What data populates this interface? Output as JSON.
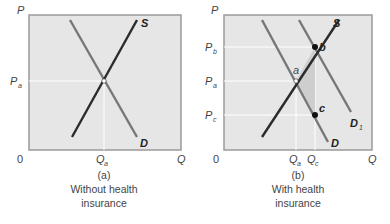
{
  "panels": [
    {
      "id": "a",
      "caption_letter": "(a)",
      "caption_line1": "Without health",
      "caption_line2": "insurance",
      "axis": {
        "y_label": "P",
        "x_label": "Q",
        "origin": "0"
      },
      "price_ticks": [
        {
          "label": "P",
          "sub": "a"
        }
      ],
      "quantity_ticks": [
        {
          "label": "Q",
          "sub": "a"
        }
      ],
      "curves": {
        "supply": "S",
        "demand": "D"
      }
    },
    {
      "id": "b",
      "caption_letter": "(b)",
      "caption_line1": "With health",
      "caption_line2": "insurance",
      "axis": {
        "y_label": "P",
        "x_label": "Q",
        "origin": "0"
      },
      "price_ticks": [
        {
          "label": "P",
          "sub": "b"
        },
        {
          "label": "P",
          "sub": "a"
        },
        {
          "label": "P",
          "sub": "c"
        }
      ],
      "quantity_ticks": [
        {
          "label": "Q",
          "sub": "a"
        },
        {
          "label": "Q",
          "sub": "c"
        }
      ],
      "curves": {
        "supply": "S",
        "demand": "D",
        "demand_shifted": "D",
        "demand_shifted_sub": "1"
      },
      "points": {
        "a": "a",
        "b": "b",
        "c": "c"
      }
    }
  ],
  "colors": {
    "plot_bg": "#e6e6e6",
    "frame": "#9a9a9a",
    "supply": "#2b2b2b",
    "demand": "#777777",
    "gridline": "#ffffff",
    "shade": "#c9c9c9"
  }
}
